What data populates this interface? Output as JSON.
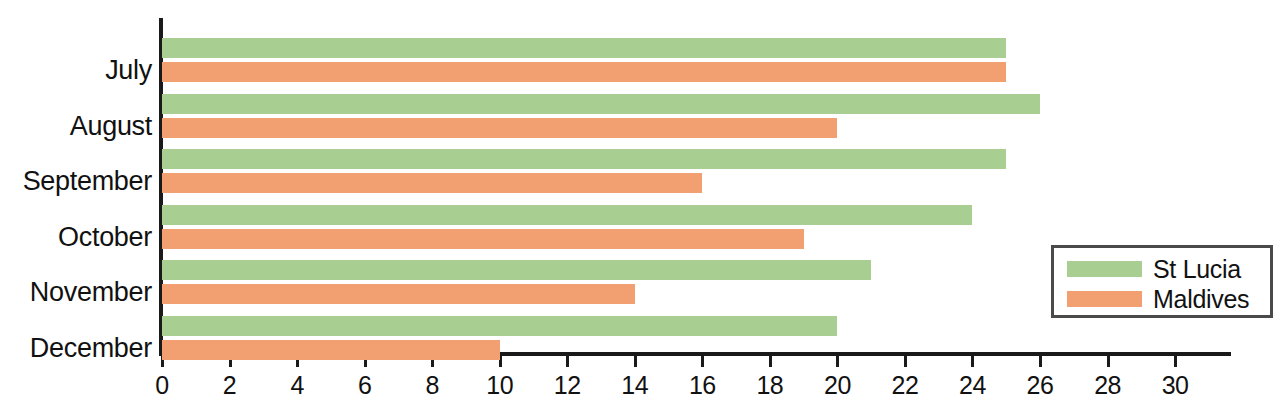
{
  "chart_data": {
    "type": "bar",
    "orientation": "horizontal",
    "title": "",
    "xlabel": "",
    "ylabel": "",
    "categories": [
      "July",
      "August",
      "September",
      "October",
      "November",
      "December"
    ],
    "series": [
      {
        "name": "St Lucia",
        "color": "#a9ce92",
        "values": [
          25,
          26,
          25,
          24,
          21,
          20
        ]
      },
      {
        "name": "Maldives",
        "color": "#f2a071",
        "values": [
          25,
          20,
          16,
          19,
          14,
          10
        ]
      }
    ],
    "xlim": [
      0,
      30
    ],
    "xticks": [
      0,
      2,
      4,
      6,
      8,
      10,
      12,
      14,
      16,
      18,
      20,
      22,
      24,
      26,
      28,
      30
    ],
    "xtick_labels": [
      "0",
      "2",
      "4",
      "6",
      "8",
      "10",
      "12",
      "14",
      "16",
      "18",
      "20",
      "22",
      "24",
      "26",
      "28",
      "30"
    ],
    "minor_tick_step": 2,
    "grid": false,
    "legend": {
      "position": "bottom-right",
      "entries": [
        {
          "label": "St Lucia",
          "color": "#a9ce92"
        },
        {
          "label": "Maldives",
          "color": "#f2a071"
        }
      ]
    }
  },
  "axes": {
    "x_zero_px": 162,
    "px_per_unit": 33.77,
    "baseline_px": 352,
    "first_row_top_px": 38,
    "row_pitch_px": 55.5,
    "bar_height_px": 20,
    "bar_gap_px": 4
  },
  "colors": {
    "green": "#a9ce92",
    "orange": "#f2a071",
    "axis": "#1a1a1a",
    "legend_border": "#4a4a4a",
    "background": "#ffffff"
  }
}
